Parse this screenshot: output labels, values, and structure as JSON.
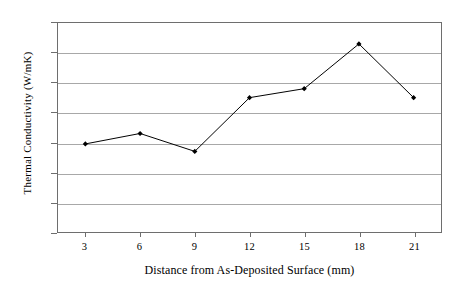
{
  "chart_data": {
    "type": "line",
    "title": "",
    "xlabel": "Distance from As-Deposited Surface (mm)",
    "ylabel": "Thermal Conductivity (W/mK)",
    "x": [
      3,
      6,
      9,
      12,
      15,
      18,
      21
    ],
    "values": [
      329.5,
      333,
      327,
      345,
      348,
      363,
      345
    ],
    "series": [
      {
        "name": "Thermal Conductivity",
        "values": [
          329.5,
          333,
          327,
          345,
          348,
          363,
          345
        ]
      }
    ],
    "xlim": [
      1.5,
      22.5
    ],
    "ylim": [
      300,
      370
    ],
    "xticks": [
      "3",
      "6",
      "9",
      "12",
      "15",
      "18",
      "21"
    ],
    "yticks": [
      "300",
      "310",
      "320",
      "330",
      "340",
      "350",
      "360",
      "370"
    ],
    "grid": "horizontal",
    "legend": "none",
    "marker": "diamond",
    "line_color": "#000000",
    "marker_color": "#000000",
    "grid_color": "#a8a8a8",
    "axis_color": "#6e6e6e",
    "background_color": "#ffffff"
  }
}
